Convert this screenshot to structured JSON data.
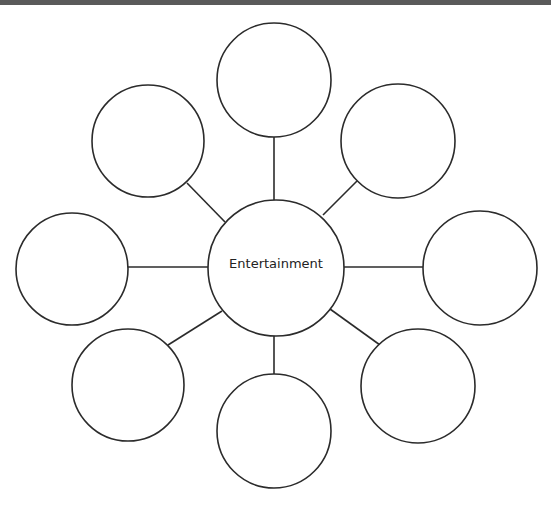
{
  "diagram": {
    "type": "bubble-map",
    "center": {
      "label": "Entertainment",
      "cx": 276,
      "cy": 268,
      "r": 68
    },
    "satellites": [
      {
        "id": "top",
        "label": "",
        "cx": 274,
        "cy": 80,
        "r": 57
      },
      {
        "id": "top-right",
        "label": "",
        "cx": 398,
        "cy": 141,
        "r": 57
      },
      {
        "id": "right",
        "label": "",
        "cx": 480,
        "cy": 268,
        "r": 57
      },
      {
        "id": "bottom-right",
        "label": "",
        "cx": 418,
        "cy": 386,
        "r": 57
      },
      {
        "id": "bottom",
        "label": "",
        "cx": 274,
        "cy": 431,
        "r": 57
      },
      {
        "id": "bottom-left",
        "label": "",
        "cx": 128,
        "cy": 385,
        "r": 56
      },
      {
        "id": "left",
        "label": "",
        "cx": 72,
        "cy": 269,
        "r": 56
      },
      {
        "id": "top-left",
        "label": "",
        "cx": 148,
        "cy": 141,
        "r": 56
      }
    ],
    "colors": {
      "stroke": "#2b2b2b",
      "fill": "#ffffff",
      "topbar": "#5a5a5a"
    }
  }
}
